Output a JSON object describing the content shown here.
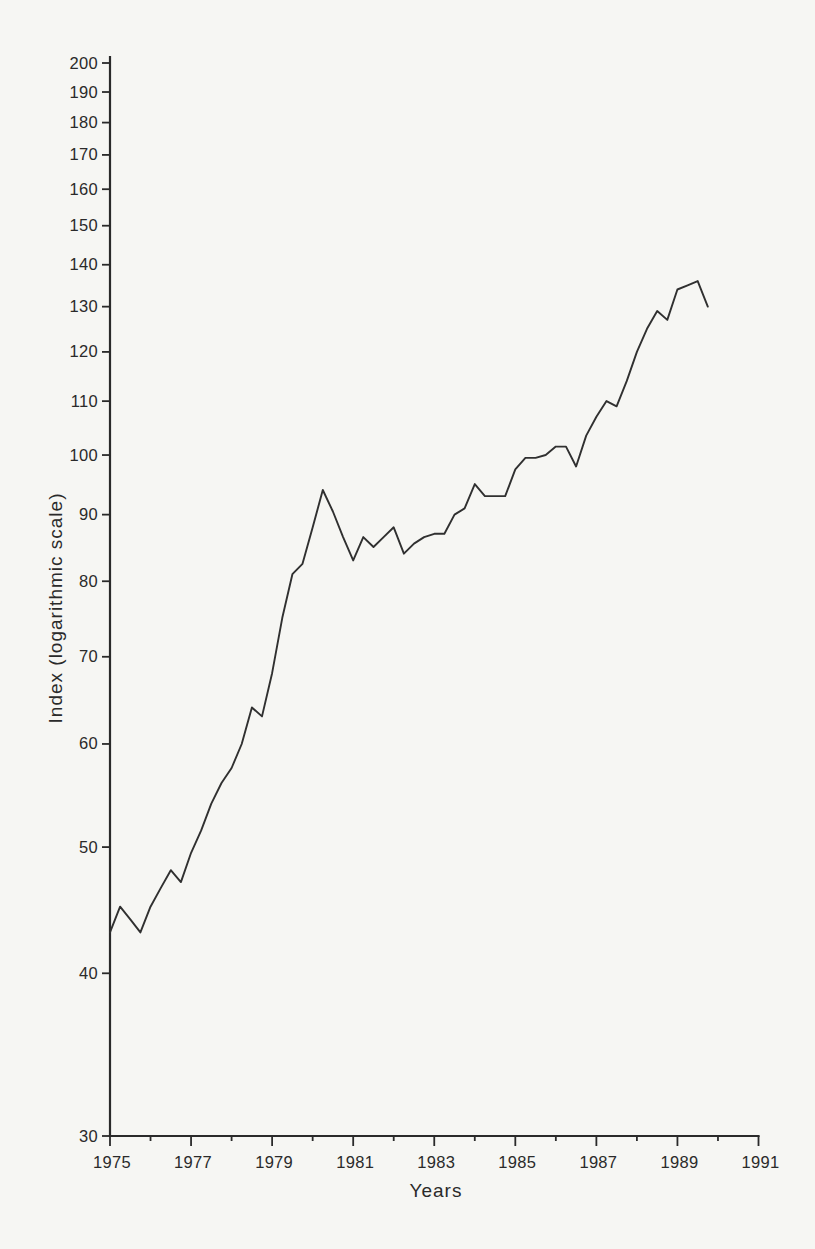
{
  "page": {
    "background_color": "#f6f6f3",
    "ink_color": "#2a2a2a"
  },
  "chart_data": {
    "type": "line",
    "title": "",
    "xlabel": "Years",
    "ylabel": "Index (logarithmic scale)",
    "grid": false,
    "legend": false,
    "x_axis": {
      "min": 1975,
      "max": 1991,
      "major_ticks": [
        1975,
        1977,
        1979,
        1981,
        1983,
        1985,
        1987,
        1989,
        1991
      ],
      "minor_ticks": [
        1976,
        1978,
        1980,
        1982,
        1984,
        1986,
        1988,
        1990
      ]
    },
    "y_axis": {
      "scale": "log",
      "min": 30,
      "max": 200,
      "ticks": [
        30,
        40,
        50,
        60,
        70,
        80,
        90,
        100,
        110,
        120,
        130,
        140,
        150,
        160,
        170,
        180,
        190,
        200
      ]
    },
    "series": [
      {
        "name": "Index",
        "x_start": 1975.0,
        "x_step": 0.25,
        "values": [
          43,
          45,
          44,
          43,
          45,
          46.5,
          48,
          47,
          49.5,
          51.5,
          54,
          56,
          57.5,
          60,
          64,
          63,
          68,
          75,
          81,
          82.5,
          88,
          94,
          90.5,
          86.5,
          83,
          86.5,
          85,
          86.5,
          88,
          84,
          85.5,
          86.5,
          87,
          87,
          90,
          91,
          95,
          93,
          93,
          93,
          97.5,
          99.5,
          99.5,
          100,
          101.5,
          101.5,
          98,
          103.5,
          107,
          110,
          109,
          114,
          120,
          125,
          129,
          127,
          134,
          135,
          136,
          130
        ]
      }
    ]
  }
}
